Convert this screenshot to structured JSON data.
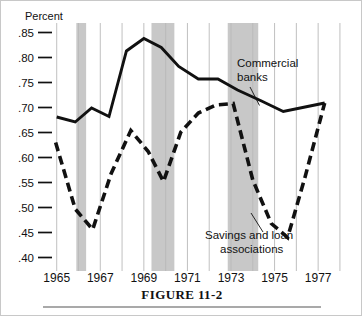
{
  "figure": {
    "caption": "FIGURE 11-2",
    "yaxis_title": "Percent"
  },
  "annotations": {
    "commercial_banks_line1": "Commercial",
    "commercial_banks_line2": "banks",
    "savings_loan_line1": "Savings and loan",
    "savings_loan_line2": "associations"
  },
  "colors": {
    "line": "#111111",
    "recession_band": "#b3b3b3",
    "gridline": "#b9b9b9",
    "background": "#ffffff",
    "text": "#111111"
  },
  "chart_data": {
    "type": "line",
    "title": "FIGURE 11-2",
    "xlabel": "",
    "ylabel": "Percent",
    "xlim": [
      1964.6,
      1978.6
    ],
    "ylim": [
      0.385,
      0.865
    ],
    "grid": true,
    "grid_axis": "x",
    "legend_position": "inline-annotations",
    "ytick_labels": [
      ".85",
      ".80",
      ".75",
      ".70",
      ".65",
      ".60",
      ".55",
      ".50",
      ".45",
      ".40"
    ],
    "ytick_values": [
      0.85,
      0.8,
      0.75,
      0.7,
      0.65,
      0.6,
      0.55,
      0.5,
      0.45,
      0.4
    ],
    "xtick_labels": [
      "1965",
      "1967",
      "1969",
      "1971",
      "1973",
      "1975",
      "1977"
    ],
    "xtick_values": [
      1965,
      1967,
      1969,
      1971,
      1973,
      1975,
      1977
    ],
    "gridline_years": [
      1965,
      1966,
      1967,
      1968,
      1969,
      1970,
      1971,
      1972,
      1973,
      1974,
      1975,
      1976,
      1977,
      1978
    ],
    "shaded_bands": [
      {
        "label": "recession",
        "start": 1965.9,
        "end": 1966.35
      },
      {
        "label": "recession",
        "start": 1969.35,
        "end": 1970.4
      },
      {
        "label": "recession",
        "start": 1972.85,
        "end": 1974.25
      }
    ],
    "series": [
      {
        "name": "Commercial banks",
        "style": "solid",
        "x": [
          1965.0,
          1965.85,
          1966.6,
          1967.4,
          1968.2,
          1969.0,
          1969.8,
          1970.6,
          1971.5,
          1972.4,
          1973.3,
          1974.4,
          1975.4,
          1976.4,
          1977.3
        ],
        "values": [
          0.681,
          0.671,
          0.699,
          0.682,
          0.813,
          0.838,
          0.82,
          0.782,
          0.757,
          0.757,
          0.735,
          0.713,
          0.692,
          0.701,
          0.709
        ]
      },
      {
        "name": "Savings and loan associations",
        "style": "dashed",
        "x": [
          1964.95,
          1965.85,
          1966.65,
          1967.5,
          1968.4,
          1969.2,
          1969.9,
          1970.7,
          1971.5,
          1972.3,
          1973.1,
          1974.0,
          1974.85,
          1975.6,
          1976.4,
          1977.3
        ],
        "values": [
          0.63,
          0.497,
          0.456,
          0.568,
          0.654,
          0.612,
          0.552,
          0.651,
          0.689,
          0.705,
          0.708,
          0.555,
          0.468,
          0.44,
          0.561,
          0.709
        ]
      }
    ]
  }
}
